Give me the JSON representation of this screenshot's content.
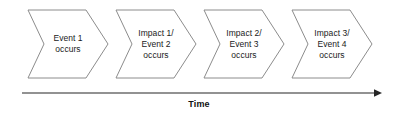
{
  "diagram": {
    "type": "timeline-chevron-sequence",
    "background_color": "#ffffff",
    "shape_fill": "#ffffff",
    "shape_border_color": "#8c8c8c",
    "text_color": "#1a1a1a",
    "axis_color": "#262626",
    "stages": [
      {
        "id": "stage-1",
        "lines": [
          "Event 1",
          "occurs"
        ],
        "x": 24
      },
      {
        "id": "stage-2",
        "lines": [
          "Impact 1/",
          "Event 2",
          "occurs"
        ],
        "x": 112
      },
      {
        "id": "stage-3",
        "lines": [
          "Impact 2/",
          "Event 3",
          "occurs"
        ],
        "x": 200
      },
      {
        "id": "stage-4",
        "lines": [
          "Impact 3/",
          "Event 4",
          "occurs"
        ],
        "x": 288
      }
    ],
    "axis": {
      "label": "Time",
      "direction": "left-to-right",
      "arrowhead": "right"
    }
  }
}
